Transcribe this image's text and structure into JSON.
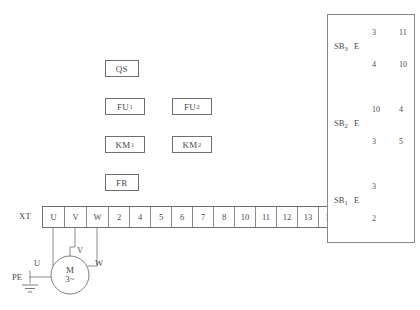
{
  "diagram": {
    "components": [
      {
        "id": "qs",
        "label": "QS",
        "sub": "",
        "x": 105,
        "y": 60,
        "w": 34,
        "h": 17
      },
      {
        "id": "fu1",
        "label": "FU",
        "sub": "1",
        "x": 105,
        "y": 98,
        "w": 40,
        "h": 17
      },
      {
        "id": "fu2",
        "label": "FU",
        "sub": "2",
        "x": 172,
        "y": 98,
        "w": 40,
        "h": 17
      },
      {
        "id": "km1",
        "label": "KM",
        "sub": "1",
        "x": 105,
        "y": 136,
        "w": 40,
        "h": 17
      },
      {
        "id": "km2",
        "label": "KM",
        "sub": "2",
        "x": 172,
        "y": 136,
        "w": 40,
        "h": 17
      },
      {
        "id": "fr",
        "label": "FR",
        "sub": "",
        "x": 105,
        "y": 174,
        "w": 34,
        "h": 17
      }
    ],
    "terminal_strip": {
      "name": "XT",
      "x": 42,
      "y": 206,
      "cells": [
        {
          "label": "U",
          "w": 22
        },
        {
          "label": "V",
          "w": 22
        },
        {
          "label": "W",
          "w": 22
        },
        {
          "label": "2",
          "w": 21
        },
        {
          "label": "4",
          "w": 21
        },
        {
          "label": "5",
          "w": 21
        },
        {
          "label": "6",
          "w": 21
        },
        {
          "label": "7",
          "w": 21
        },
        {
          "label": "8",
          "w": 21
        },
        {
          "label": "10",
          "w": 21
        },
        {
          "label": "11",
          "w": 21
        },
        {
          "label": "12",
          "w": 21
        },
        {
          "label": "13",
          "w": 21
        },
        {
          "label": "14",
          "w": 21
        }
      ]
    },
    "motor": {
      "designator": "M",
      "phase": "3~",
      "cx": 70,
      "cy": 275,
      "r": 19,
      "lead_labels": [
        {
          "label": "U",
          "x": 34,
          "y": 258
        },
        {
          "label": "V",
          "x": 77,
          "y": 245
        },
        {
          "label": "W",
          "x": 95,
          "y": 258
        }
      ]
    },
    "earth": {
      "label": "PE",
      "x": 12,
      "y": 272
    },
    "sb_panel": {
      "x": 327,
      "y": 14,
      "w": 88,
      "h": 229,
      "sections": [
        {
          "name": "SB",
          "sub": "3",
          "actuator": "E",
          "left_top": "3",
          "left_bottom": "4",
          "right_top": "11",
          "right_bottom": "10"
        },
        {
          "name": "SB",
          "sub": "2",
          "actuator": "E",
          "left_top": "10",
          "left_bottom": "3",
          "right_top": "4",
          "right_bottom": "5"
        },
        {
          "name": "SB",
          "sub": "1",
          "actuator": "E",
          "left_top": "3",
          "left_bottom": "2",
          "right_top": "",
          "right_bottom": ""
        }
      ]
    },
    "colors": {
      "line": "#6f6f6f",
      "line_light": "#9a9a9a",
      "text": "#4a4a4a",
      "background": "#ffffff"
    }
  }
}
